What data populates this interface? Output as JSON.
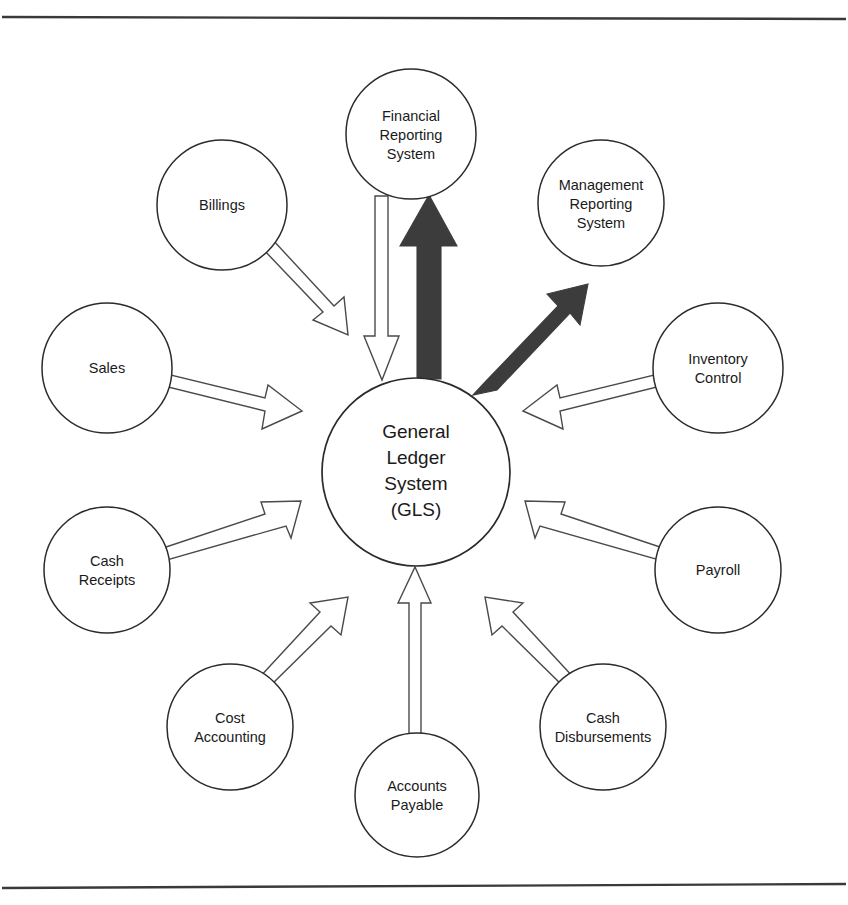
{
  "figure": {
    "title": "General Ledger System",
    "background_color": "#ffffff",
    "line_color": "#2b2b2b",
    "hollow_arrow_fill": "#ffffff",
    "hollow_arrow_stroke": "#4a4a4a",
    "solid_arrow_fill": "#3c3c3c",
    "rule_color": "#3a3a3a"
  },
  "rules": [
    {
      "name": "top-rule",
      "y": 18
    },
    {
      "name": "bottom-rule",
      "y": 886
    }
  ],
  "center_node": {
    "id": "gls",
    "label_lines": [
      "General",
      "Ledger",
      "System",
      "(GLS)"
    ],
    "line1": "General",
    "line2": "Ledger",
    "line3": "System",
    "line4": "(GLS)",
    "cx": 416,
    "cy": 472,
    "r": 94
  },
  "nodes": [
    {
      "id": "financial-reporting-system",
      "label_lines": [
        "Financial",
        "Reporting",
        "System"
      ],
      "line1": "Financial",
      "line2": "Reporting",
      "line3": "System",
      "cx": 411,
      "cy": 134,
      "r": 65
    },
    {
      "id": "management-reporting-system",
      "label_lines": [
        "Management",
        "Reporting",
        "System"
      ],
      "line1": "Management",
      "line2": "Reporting",
      "line3": "System",
      "cx": 601,
      "cy": 203,
      "r": 63
    },
    {
      "id": "billings",
      "label_lines": [
        "Billings"
      ],
      "line1": "Billings",
      "line2": "",
      "line3": "",
      "cx": 222,
      "cy": 205,
      "r": 65
    },
    {
      "id": "sales",
      "label_lines": [
        "Sales"
      ],
      "line1": "Sales",
      "line2": "",
      "line3": "",
      "cx": 107,
      "cy": 368,
      "r": 65
    },
    {
      "id": "cash-receipts",
      "label_lines": [
        "Cash",
        "Receipts"
      ],
      "line1": "Cash",
      "line2": "Receipts",
      "line3": "",
      "cx": 107,
      "cy": 570,
      "r": 63
    },
    {
      "id": "cost-accounting",
      "label_lines": [
        "Cost",
        "Accounting"
      ],
      "line1": "Cost",
      "line2": "Accounting",
      "line3": "",
      "cx": 230,
      "cy": 727,
      "r": 63
    },
    {
      "id": "accounts-payable",
      "label_lines": [
        "Accounts",
        "Payable"
      ],
      "line1": "Accounts",
      "line2": "Payable",
      "line3": "",
      "cx": 417,
      "cy": 795,
      "r": 62
    },
    {
      "id": "cash-disbursements",
      "label_lines": [
        "Cash",
        "Disbursements"
      ],
      "line1": "Cash",
      "line2": "Disbursements",
      "line3": "",
      "cx": 603,
      "cy": 727,
      "r": 63
    },
    {
      "id": "payroll",
      "label_lines": [
        "Payroll"
      ],
      "line1": "Payroll",
      "line2": "",
      "line3": "",
      "cx": 718,
      "cy": 570,
      "r": 63
    },
    {
      "id": "inventory-control",
      "label_lines": [
        "Inventory",
        "Control"
      ],
      "line1": "Inventory",
      "line2": "Control",
      "line3": "",
      "cx": 718,
      "cy": 368,
      "r": 65
    }
  ],
  "connections": [
    {
      "id": "billings-to-gls",
      "from": "billings",
      "to": "gls",
      "style": "hollow",
      "direction": "into-gls"
    },
    {
      "id": "sales-to-gls",
      "from": "sales",
      "to": "gls",
      "style": "hollow",
      "direction": "into-gls"
    },
    {
      "id": "cash-receipts-to-gls",
      "from": "cash-receipts",
      "to": "gls",
      "style": "hollow",
      "direction": "into-gls"
    },
    {
      "id": "cost-accounting-to-gls",
      "from": "cost-accounting",
      "to": "gls",
      "style": "hollow",
      "direction": "into-gls"
    },
    {
      "id": "accounts-payable-to-gls",
      "from": "accounts-payable",
      "to": "gls",
      "style": "hollow",
      "direction": "into-gls"
    },
    {
      "id": "cash-disbursements-to-gls",
      "from": "cash-disbursements",
      "to": "gls",
      "style": "hollow",
      "direction": "into-gls"
    },
    {
      "id": "payroll-to-gls",
      "from": "payroll",
      "to": "gls",
      "style": "hollow",
      "direction": "into-gls"
    },
    {
      "id": "inventory-control-to-gls",
      "from": "inventory-control",
      "to": "gls",
      "style": "hollow",
      "direction": "into-gls"
    },
    {
      "id": "financial-reporting-to-gls",
      "from": "financial-reporting-system",
      "to": "gls",
      "style": "hollow",
      "direction": "into-gls"
    },
    {
      "id": "gls-to-financial-reporting",
      "from": "gls",
      "to": "financial-reporting-system",
      "style": "solid",
      "direction": "out-of-gls"
    },
    {
      "id": "gls-to-management-reporting",
      "from": "gls",
      "to": "management-reporting-system",
      "style": "solid",
      "direction": "out-of-gls"
    }
  ]
}
